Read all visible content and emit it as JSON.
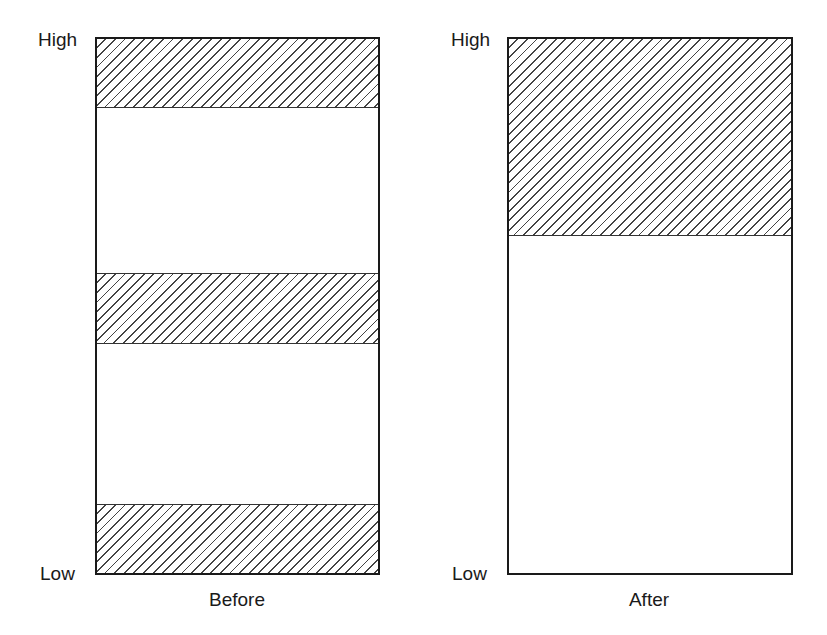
{
  "panels": [
    {
      "caption": "Before",
      "axis_top_label": "High",
      "axis_bottom_label": "Low",
      "hatched_bands": [
        {
          "position": "top",
          "from_fraction": 0.0,
          "to_fraction": 0.13
        },
        {
          "position": "middle",
          "from_fraction": 0.44,
          "to_fraction": 0.57
        },
        {
          "position": "bottom",
          "from_fraction": 0.87,
          "to_fraction": 1.0
        }
      ]
    },
    {
      "caption": "After",
      "axis_top_label": "High",
      "axis_bottom_label": "Low",
      "hatched_bands": [
        {
          "position": "top",
          "from_fraction": 0.0,
          "to_fraction": 0.37
        }
      ]
    }
  ],
  "colors": {
    "line": "#1a1a1a",
    "hatch": "#444444",
    "background": "#ffffff"
  }
}
